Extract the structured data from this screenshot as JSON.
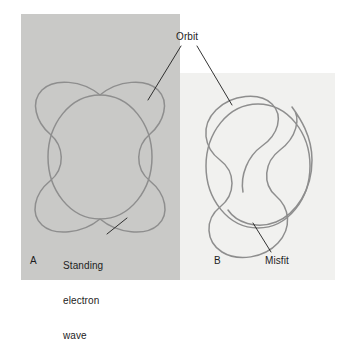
{
  "figure": {
    "background_color": "#ffffff"
  },
  "panels": [
    {
      "id": "A",
      "label": "A",
      "caption": "Standing electron wave fits the orbit",
      "background_color": "#c9c9c7",
      "rect": {
        "x": 21,
        "y": 14,
        "width": 159,
        "height": 266
      },
      "curve_color": "#8e8e8e",
      "curve_type": "closed-standing-wave",
      "wave_cycles": 4,
      "closes": true
    },
    {
      "id": "B",
      "label": "B",
      "caption": "Wave does not fit; a misfit results",
      "background_color": "#f1f1ef",
      "rect": {
        "x": 180,
        "y": 73,
        "width": 155,
        "height": 207
      },
      "curve_color": "#8e8e8e",
      "curve_type": "open-standing-wave",
      "wave_cycles": 3.5,
      "closes": false
    }
  ],
  "labels": {
    "orbit": "Orbit",
    "panel_a": "A",
    "panel_b": "B",
    "misfit": "Misfit",
    "standing_wave_line1": "Standing",
    "standing_wave_line2": "electron",
    "standing_wave_line3": "wave"
  },
  "colors": {
    "text": "#1d1d1d",
    "leader_line": "#1d1d1d",
    "curve": "#8e8e8e",
    "panel_a_bg": "#c9c9c7",
    "panel_b_bg": "#f1f1ef",
    "page_bg": "#ffffff"
  },
  "leader_lines": [
    {
      "name": "orbit-to-panel-a",
      "from": [
        181,
        46
      ],
      "to": [
        148,
        100
      ]
    },
    {
      "name": "orbit-to-panel-b",
      "from": [
        197,
        46
      ],
      "to": [
        232,
        105
      ]
    },
    {
      "name": "standing-wave-to-curve",
      "from": [
        107,
        234
      ],
      "to": [
        127,
        218
      ]
    },
    {
      "name": "misfit-to-curve",
      "from": [
        271,
        252
      ],
      "to": [
        253,
        223
      ]
    }
  ]
}
